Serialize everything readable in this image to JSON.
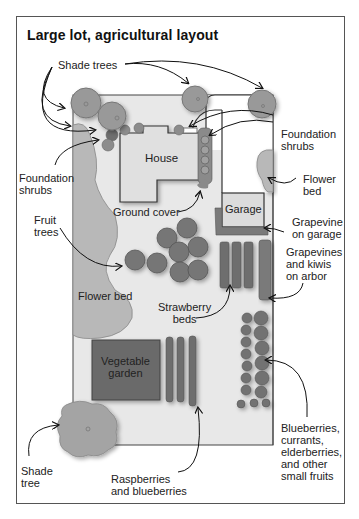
{
  "title": "Large lot, agricultural layout",
  "structures": {
    "house": "House",
    "garage": "Garage",
    "vegetable_garden": "Vegetable\ngarden",
    "flower_bed_left": "Flower bed"
  },
  "labels": {
    "shade_trees_top": "Shade trees",
    "foundation_shrubs_right": "Foundation\nshrubs",
    "foundation_shrubs_left": "Foundation\nshrubs",
    "flower_bed_right": "Flower\nbed",
    "ground_cover": "Ground cover",
    "garage_grapevine": "Grapevine\non garage",
    "fruit_trees": "Fruit\ntrees",
    "grapevines_kiwis": "Grapevines\nand kiwis\non arbor",
    "strawberry_beds": "Strawberry\nbeds",
    "blueberries": "Blueberries,\ncurrants,\nelderberries,\nand other\nsmall fruits",
    "shade_tree_bottom": "Shade\ntree",
    "raspberries": "Raspberries\nand blueberries"
  },
  "colors": {
    "lot_fill": "#e6e6e6",
    "tree_fill": "#9a9a9a",
    "dark_plant": "#6f6f6f",
    "bed_fill": "#b5b5b5",
    "veg_garden": "#6b6b6b",
    "outline": "#333333"
  }
}
